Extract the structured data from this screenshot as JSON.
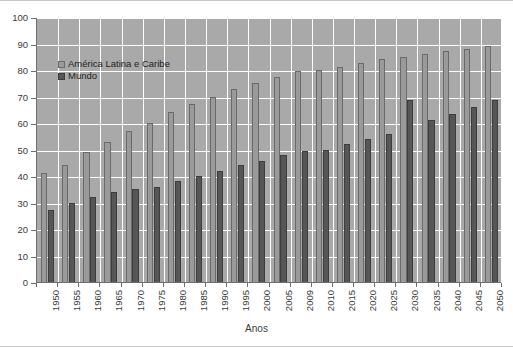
{
  "chart_data": {
    "type": "bar",
    "title": "",
    "xlabel": "Anos",
    "ylabel": "",
    "ylim": [
      0,
      100
    ],
    "ytick_step": 10,
    "yticks": [
      "0",
      "10",
      "20",
      "30",
      "40",
      "50",
      "60",
      "70",
      "80",
      "90",
      "100"
    ],
    "grid": true,
    "legend_position": "upper-left-inside",
    "categories": [
      "1950",
      "1955",
      "1960",
      "1965",
      "1970",
      "1975",
      "1980",
      "1985",
      "1990",
      "1995",
      "2000",
      "2005",
      "2009",
      "2010",
      "2015",
      "2020",
      "2025",
      "2030",
      "2035",
      "2040",
      "2045",
      "2050"
    ],
    "series": [
      {
        "name": "América Latina e Caribe",
        "color": "#9a9a9a",
        "values": [
          41,
          44,
          49,
          53,
          57,
          60,
          64,
          67,
          70,
          73,
          75,
          77.5,
          79.5,
          80,
          81,
          82.5,
          84,
          85,
          86,
          87,
          88,
          89
        ]
      },
      {
        "name": "Mundo",
        "color": "#565656",
        "values": [
          27,
          30,
          32,
          34,
          35,
          36,
          38,
          40,
          42,
          44,
          45.5,
          48,
          49.5,
          50,
          52,
          54,
          56,
          68.5,
          61,
          63.5,
          66,
          68.5
        ]
      }
    ]
  },
  "axis": {
    "x_title": "Anos"
  },
  "colors": {
    "plot_background": "#a9a9a9",
    "gridline": "#ffffff",
    "axis_line": "#6e6e6e",
    "series_lac": "#9a9a9a",
    "series_mundo": "#565656",
    "page_background": "#ffffff"
  }
}
